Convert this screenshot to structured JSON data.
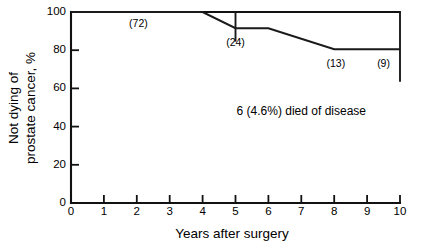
{
  "chart_data": {
    "type": "line",
    "title": "",
    "subtitle": "",
    "xlabel": "Years after surgery",
    "ylabel": "Not dying of prostate cancer, %",
    "ylabel_line1": "Not dying of",
    "ylabel_line2": "prostate cancer, %",
    "xlim": [
      0,
      10
    ],
    "ylim": [
      0,
      100
    ],
    "grid": false,
    "legend": "none",
    "xticks": [
      0,
      1,
      2,
      3,
      4,
      5,
      6,
      7,
      8,
      9,
      10
    ],
    "xtick_labels": [
      "0",
      "1",
      "2",
      "3",
      "4",
      "5",
      "6",
      "7",
      "8",
      "9",
      "10"
    ],
    "yticks": [
      0,
      20,
      40,
      60,
      80,
      100
    ],
    "ytick_labels": [
      "0",
      "20",
      "40",
      "60",
      "80",
      "100"
    ],
    "series": [
      {
        "name": "Not dying of prostate cancer",
        "x": [
          0,
          4,
          5,
          6,
          8,
          10
        ],
        "values": [
          100,
          100,
          91.5,
          91.5,
          80.5,
          80.5
        ]
      }
    ],
    "error_bars": [
      {
        "x": 5,
        "y": 91.5,
        "low": 84.5,
        "high": 100
      },
      {
        "x": 10,
        "y": 80.5,
        "low": 63.5,
        "high": 100
      }
    ],
    "point_labels": [
      {
        "text": "(72)",
        "x": 2.05,
        "y": 96.5
      },
      {
        "text": "(24)",
        "x": 5.0,
        "y": 86.5
      },
      {
        "text": "(13)",
        "x": 8.05,
        "y": 75.5
      },
      {
        "text": "(9)",
        "x": 9.5,
        "y": 75.5
      }
    ],
    "annotations": [
      {
        "text": "6 (4.6%) died of disease",
        "x": 7.0,
        "y": 50.5
      }
    ]
  }
}
